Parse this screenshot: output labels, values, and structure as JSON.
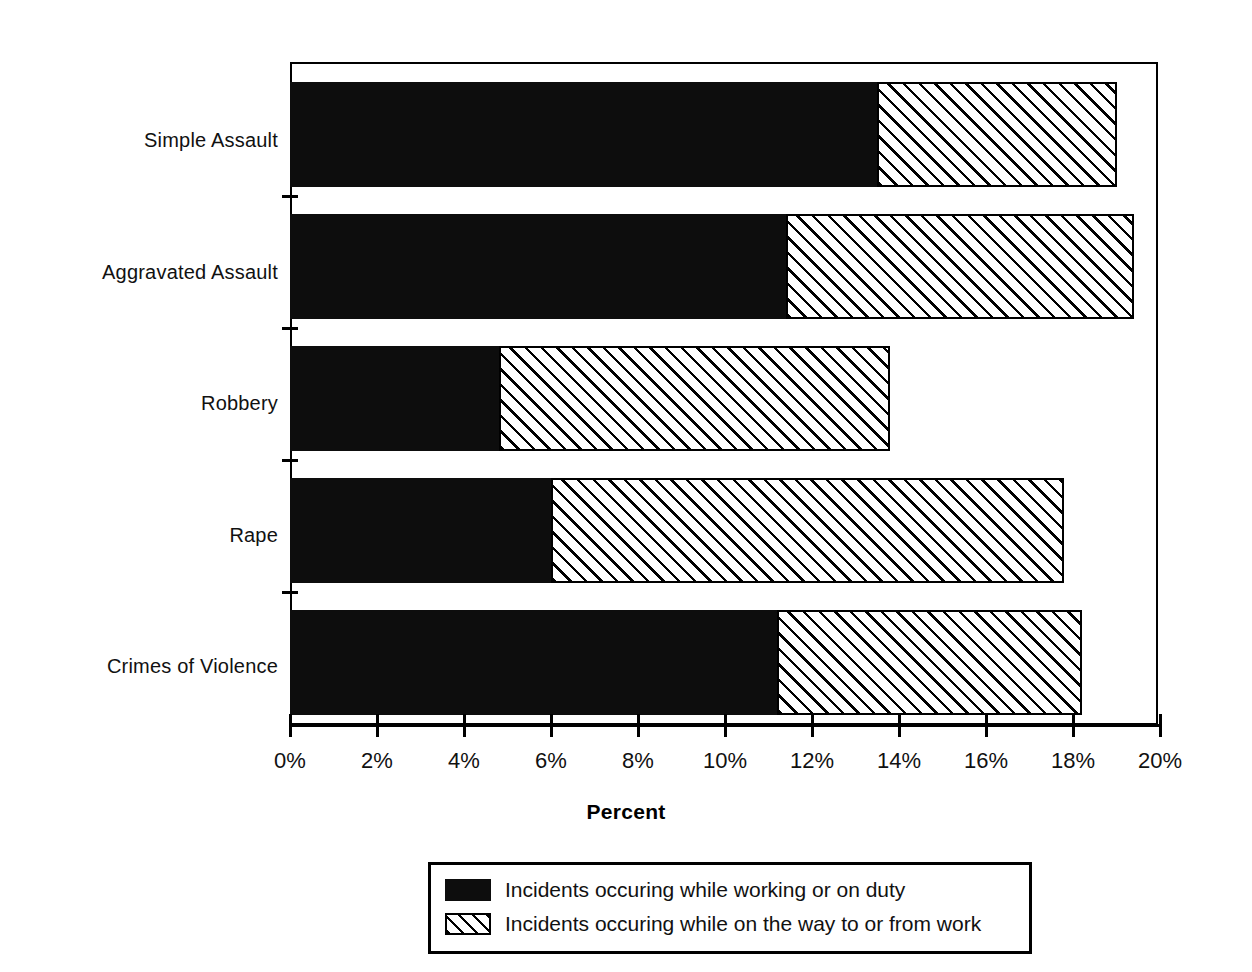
{
  "chart_data": {
    "type": "bar",
    "orientation": "horizontal",
    "stacked": true,
    "title": "",
    "xlabel": "Percent",
    "ylabel": "",
    "xlim": [
      0,
      20
    ],
    "xtick_labels": [
      "0%",
      "2%",
      "4%",
      "6%",
      "8%",
      "10%",
      "12%",
      "14%",
      "16%",
      "18%",
      "20%"
    ],
    "xtick_values": [
      0,
      2,
      4,
      6,
      8,
      10,
      12,
      14,
      16,
      18,
      20
    ],
    "grid": false,
    "legend_position": "bottom",
    "categories": [
      "Simple Assault",
      "Aggravated Assault",
      "Robbery",
      "Rape",
      "Crimes of Violence"
    ],
    "series": [
      {
        "name": "Incidents occuring while working or on duty",
        "fill": "solid-black",
        "values": [
          13.5,
          11.4,
          4.8,
          6.0,
          11.2
        ]
      },
      {
        "name": "Incidents occuring while on the way to or from work",
        "fill": "diagonal-hatch",
        "values": [
          5.5,
          8.0,
          9.0,
          11.8,
          7.0
        ]
      }
    ],
    "totals": [
      19.0,
      19.4,
      13.8,
      17.8,
      18.2
    ]
  },
  "axis": {
    "x_title": "Percent"
  },
  "legend": {
    "items": [
      {
        "label": "Incidents occuring while working or on duty",
        "swatch": "solid-black"
      },
      {
        "label": "Incidents occuring while on the way to or from work",
        "swatch": "diagonal-hatch"
      }
    ]
  },
  "colors": {
    "series_working": "#0d0d0d",
    "series_commute": "#ffffff",
    "axis": "#000000",
    "background": "#ffffff"
  }
}
